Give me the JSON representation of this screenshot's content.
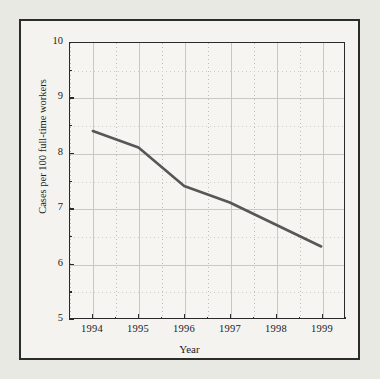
{
  "chart_data": {
    "type": "line",
    "title": "",
    "xlabel": "Year",
    "ylabel": "Cases per 100 full-time workers",
    "categories": [
      "1994",
      "1995",
      "1996",
      "1997",
      "1998",
      "1999"
    ],
    "x": [
      1994,
      1995,
      1996,
      1997,
      1998,
      1999
    ],
    "values": [
      8.4,
      8.1,
      7.4,
      7.1,
      6.7,
      6.3
    ],
    "series": [
      {
        "name": "Cases per 100 full-time workers",
        "values": [
          8.4,
          8.1,
          7.4,
          7.1,
          6.7,
          6.3
        ]
      }
    ],
    "xlim": [
      1993.5,
      1999.5
    ],
    "ylim": [
      5,
      10
    ],
    "yticks": [
      5,
      6,
      7,
      8,
      9,
      10
    ],
    "ytick_labels": [
      "5",
      "6",
      "7",
      "8",
      "9",
      "10"
    ],
    "xticks": [
      1994,
      1995,
      1996,
      1997,
      1998,
      1999
    ],
    "xtick_labels": [
      "1994",
      "1995",
      "1996",
      "1997",
      "1998",
      "1999"
    ],
    "x_minor_per_major": 2,
    "grid": true,
    "grid_major_color": "#c9c9c4",
    "grid_minor_color": "#bdbdb8",
    "legend": false,
    "legend_position": "none",
    "line_color": "#575757",
    "line_width": 2.6,
    "markers": false,
    "background_color": "#f4f3ef",
    "plot_background_color": "#f6f5f1",
    "axis_color": "#2a2a2a",
    "frame_border_color": "#2c2c2c",
    "page_background_color": "#e9e9e4"
  }
}
